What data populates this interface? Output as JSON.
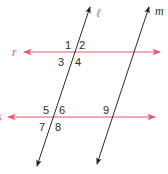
{
  "diagram": {
    "type": "parallel-lines-transversals",
    "colors": {
      "transversal_lines": "#e8546a",
      "parallel_lines": "#2b2b2b",
      "labels": "#2b2b2b",
      "line_labels_pink": "#e8546a",
      "background": "#ffffff"
    },
    "lines": [
      {
        "id": "r",
        "label": "r",
        "color": "#e8546a"
      },
      {
        "id": "s",
        "label": "s",
        "color": "#e8546a"
      },
      {
        "id": "l",
        "label": "ℓ",
        "color": "#2b2b2b"
      },
      {
        "id": "m",
        "label": "m",
        "color": "#2b2b2b"
      }
    ],
    "angles": [
      {
        "id": "1",
        "label": "1"
      },
      {
        "id": "2",
        "label": "2"
      },
      {
        "id": "3",
        "label": "3"
      },
      {
        "id": "4",
        "label": "4"
      },
      {
        "id": "5",
        "label": "5"
      },
      {
        "id": "6",
        "label": "6"
      },
      {
        "id": "7",
        "label": "7"
      },
      {
        "id": "8",
        "label": "8"
      },
      {
        "id": "9",
        "label": "9"
      }
    ]
  }
}
